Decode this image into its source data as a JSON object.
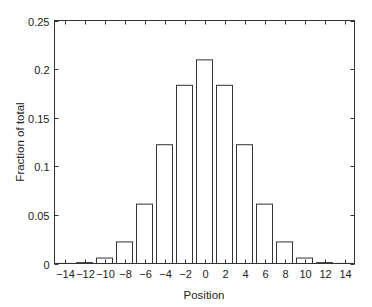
{
  "chart_data": {
    "type": "bar",
    "title": "",
    "xlabel": "Position",
    "ylabel": "Fraction of total",
    "xlim": [
      -15,
      15
    ],
    "ylim": [
      0,
      0.25
    ],
    "grid": false,
    "legend": null,
    "bar_width_units": 1.6,
    "bar_fill": "#ffffff",
    "bar_edge": "#333333",
    "x": [
      -14,
      -12,
      -10,
      -8,
      -6,
      -4,
      -2,
      0,
      2,
      4,
      6,
      8,
      10,
      12,
      14
    ],
    "values": [
      0.0001,
      0.0009,
      0.0056,
      0.0222,
      0.0611,
      0.1222,
      0.1833,
      0.2095,
      0.1833,
      0.1222,
      0.0611,
      0.0222,
      0.0056,
      0.0009,
      0.0001
    ],
    "xticks": [
      -14,
      -12,
      -10,
      -8,
      -6,
      -4,
      -2,
      0,
      2,
      4,
      6,
      8,
      10,
      12,
      14
    ],
    "xtick_labels": [
      "−14",
      "−12",
      "−10",
      "−8",
      "−6",
      "−4",
      "−2",
      "0",
      "2",
      "4",
      "6",
      "8",
      "10",
      "12",
      "14"
    ],
    "yticks": [
      0,
      0.05,
      0.1,
      0.15,
      0.2,
      0.25
    ],
    "ytick_labels": [
      "0",
      "0.05",
      "0.1",
      "0.15",
      "0.2",
      "0.25"
    ]
  }
}
